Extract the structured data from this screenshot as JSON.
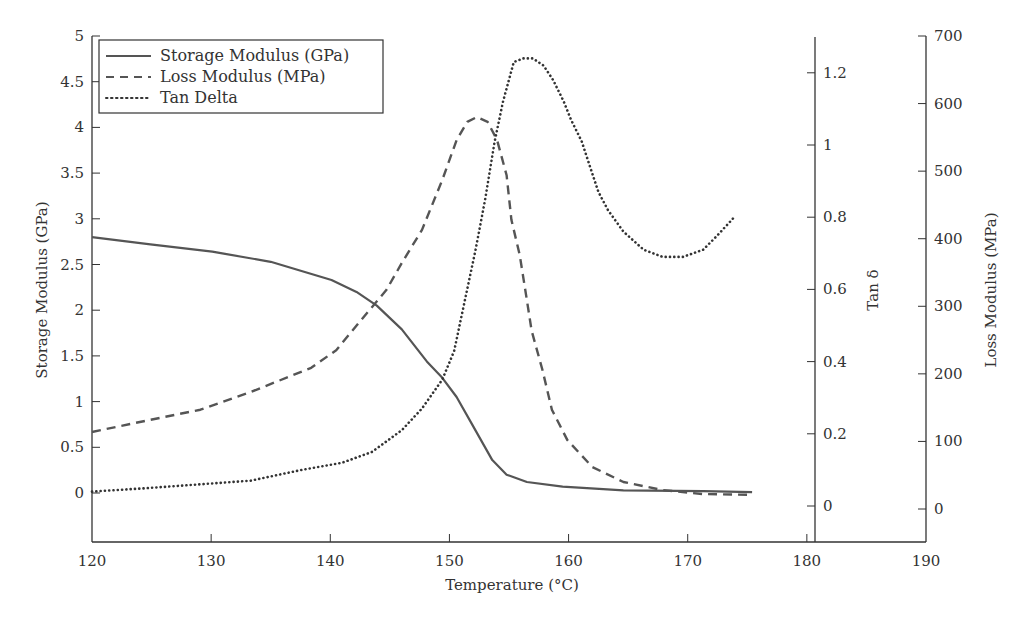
{
  "chart_data": {
    "type": "line",
    "title": "",
    "xlabel": "Temperature (°C)",
    "xlim": [
      120,
      190
    ],
    "x_ticks": [
      120,
      130,
      140,
      150,
      160,
      170,
      180,
      190
    ],
    "grid": false,
    "legend_position": "upper left",
    "axes": {
      "left": {
        "label": "Storage Modulus (GPa)",
        "ylim": [
          -0.55,
          5
        ],
        "ticks": [
          0,
          0.5,
          1,
          1.5,
          2,
          2.5,
          3,
          3.5,
          4,
          4.5,
          5
        ]
      },
      "right_inner": {
        "label": "Tan δ",
        "ylim": [
          -0.17,
          1.3
        ],
        "ticks": [
          0,
          0.2,
          0.4,
          0.6,
          0.8,
          1,
          1.2
        ],
        "position_x": 180.6
      },
      "right_outer": {
        "label": "Loss Modulus (MPa)",
        "ylim": [
          -50,
          700
        ],
        "ticks": [
          0,
          100,
          200,
          300,
          400,
          500,
          600,
          700
        ]
      }
    },
    "series": [
      {
        "name": "Storage Modulus (GPa)",
        "axis": "left",
        "style": "solid",
        "x": [
          120,
          124.9,
          130.1,
          135.0,
          140.1,
          142.2,
          143.9,
          146.0,
          148.1,
          149.4,
          150.6,
          151.9,
          153.6,
          154.8,
          156.5,
          159.5,
          164.6,
          171.3,
          175.4
        ],
        "y": [
          2.8,
          2.72,
          2.64,
          2.53,
          2.33,
          2.2,
          2.05,
          1.79,
          1.44,
          1.26,
          1.05,
          0.75,
          0.36,
          0.2,
          0.12,
          0.07,
          0.03,
          0.02,
          0.01
        ]
      },
      {
        "name": "Loss Modulus (MPa)",
        "axis": "right_outer",
        "style": "dashed",
        "x": [
          120,
          124.9,
          129.1,
          133.3,
          138.4,
          140.5,
          142.6,
          144.7,
          146.0,
          147.7,
          149.4,
          150.6,
          151.5,
          152.3,
          153.2,
          154.0,
          154.8,
          155.2,
          155.9,
          156.5,
          156.9,
          157.8,
          158.6,
          159.9,
          162.0,
          164.6,
          167.9,
          171.3,
          175.4
        ],
        "y": [
          114,
          132,
          147,
          173,
          209,
          235,
          280,
          324,
          364,
          413,
          487,
          546,
          573,
          580,
          573,
          546,
          494,
          428,
          376,
          309,
          264,
          206,
          147,
          102,
          62,
          40,
          28,
          22,
          21
        ]
      },
      {
        "name": "Tan Delta",
        "axis": "right_inner",
        "style": "dotted",
        "x": [
          120,
          124.9,
          129.1,
          133.3,
          137.6,
          141.0,
          143.5,
          146.0,
          147.7,
          149.4,
          150.4,
          151.3,
          152.2,
          153.0,
          153.8,
          154.5,
          155.4,
          156.2,
          157.0,
          157.9,
          158.7,
          159.6,
          160.2,
          161.1,
          161.9,
          162.5,
          163.3,
          164.6,
          166.3,
          167.9,
          169.6,
          171.3,
          172.5,
          173.9
        ],
        "y": [
          0.04,
          0.05,
          0.06,
          0.07,
          0.1,
          0.12,
          0.15,
          0.21,
          0.27,
          0.35,
          0.43,
          0.57,
          0.71,
          0.85,
          1.01,
          1.12,
          1.23,
          1.24,
          1.24,
          1.22,
          1.18,
          1.12,
          1.07,
          1.01,
          0.93,
          0.87,
          0.82,
          0.76,
          0.71,
          0.69,
          0.69,
          0.71,
          0.75,
          0.8
        ]
      }
    ]
  },
  "legend": {
    "items": [
      {
        "label": "Storage Modulus (GPa)",
        "style": "solid"
      },
      {
        "label": "Loss Modulus (MPa)",
        "style": "dashed"
      },
      {
        "label": "Tan Delta",
        "style": "dotted"
      }
    ]
  },
  "labels": {
    "xlabel": "Temperature (°C)",
    "left_ylabel": "Storage Modulus (GPa)",
    "tan_ylabel": "Tan δ",
    "loss_ylabel": "Loss Modulus (MPa)"
  },
  "colors": {
    "line": "#555555",
    "axis": "#333333",
    "text": "#333333"
  }
}
